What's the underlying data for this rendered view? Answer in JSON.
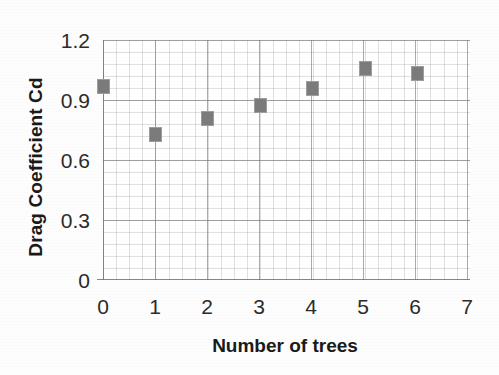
{
  "chart_data": {
    "type": "scatter",
    "title": "",
    "xlabel": "Number of trees",
    "ylabel": "Drag Coefficient Cd",
    "x": [
      0,
      1,
      2,
      3,
      4,
      5,
      6
    ],
    "values": [
      0.97,
      0.73,
      0.81,
      0.875,
      0.96,
      1.06,
      1.035
    ],
    "series": [
      {
        "name": "Drag Coefficient Cd",
        "marker": "square",
        "color": "#7b7b7b",
        "points": [
          {
            "x": 0,
            "y": 0.97
          },
          {
            "x": 1,
            "y": 0.73
          },
          {
            "x": 2,
            "y": 0.81
          },
          {
            "x": 3,
            "y": 0.875
          },
          {
            "x": 4,
            "y": 0.96
          },
          {
            "x": 5,
            "y": 1.06
          },
          {
            "x": 6,
            "y": 1.035
          }
        ]
      }
    ],
    "xlim": [
      0,
      7
    ],
    "ylim": [
      0,
      1.2
    ],
    "xticks": [
      "0",
      "1",
      "2",
      "3",
      "4",
      "5",
      "6",
      "7"
    ],
    "yticks": [
      "0",
      "0.3",
      "0.6",
      "0.9",
      "1.2"
    ],
    "ytick_values": [
      0,
      0.3,
      0.6,
      0.9,
      1.2
    ],
    "xtick_values": [
      0,
      1,
      2,
      3,
      4,
      5,
      6,
      7
    ],
    "grid": true,
    "minor_grid": true,
    "legend": false,
    "legend_position": "none",
    "annotations": []
  },
  "axes": {
    "y_title": "Drag Coefficient Cd",
    "x_title": "Number of trees"
  },
  "colors": {
    "marker": "#7b7b7b",
    "marker_edge": "#9d9d9d",
    "grid_major": "#787878",
    "grid_minor": "#969696",
    "text": "#2b2b2b",
    "background": "#ffffff"
  }
}
